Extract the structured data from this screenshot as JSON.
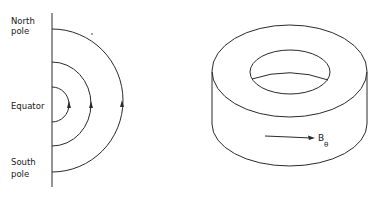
{
  "left_figure": {
    "title": "Meridional field lines",
    "labels": {
      "north_line1": "North",
      "north_line2": "pole",
      "equator": "Equator",
      "south_line1": "South",
      "south_line2": "pole"
    },
    "field_lines": [
      {
        "name": "inner",
        "radius": 17
      },
      {
        "name": "middle",
        "radius": 42
      },
      {
        "name": "outer",
        "radius": 71
      }
    ],
    "arrow_direction": "up"
  },
  "right_figure": {
    "title": "Toroidal field",
    "field_label": "B",
    "field_subscript": "θ",
    "arrow_direction": "right"
  },
  "colors": {
    "line": "#2a2a2a",
    "background": "#ffffff"
  }
}
